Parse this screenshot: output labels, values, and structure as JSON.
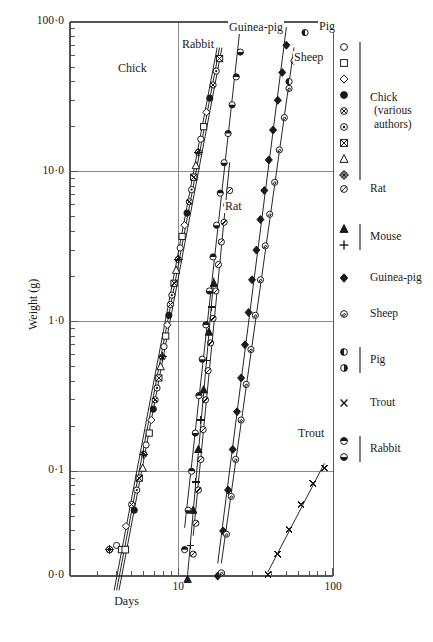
{
  "chart_data": {
    "type": "scatter",
    "title": "",
    "xlabel": "Days",
    "ylabel": "Weight (g)",
    "xscale": "log",
    "yscale": "log",
    "xlim": [
      2,
      100
    ],
    "ylim": [
      0.02,
      100
    ],
    "xticklabels": [
      "10",
      "100"
    ],
    "xtickvalues": [
      10,
      100
    ],
    "yticklabels": [
      "100·0",
      "10·0",
      "1·0",
      "0·1",
      "0·0"
    ],
    "ytickvalues": [
      100,
      10,
      1,
      0.1,
      0.02
    ],
    "grid": "major-horizontal-and-vertical",
    "legend_position": "right",
    "annotations": [
      {
        "text": "Chick",
        "x": 9.0,
        "y": 11.0
      },
      {
        "text": "Rabbit",
        "x": 15.5,
        "y": 45.0
      },
      {
        "text": "Guinea-pig",
        "x": 28.0,
        "y": 80.0
      },
      {
        "text": "Sheep",
        "x": 40.0,
        "y": 47.0
      },
      {
        "text": "Pig",
        "x": 62.0,
        "y": 82.0
      },
      {
        "text": "Rat",
        "x": 17.0,
        "y": 4.2
      },
      {
        "text": "Trout",
        "x": 62.0,
        "y": 0.14
      }
    ],
    "series": [
      {
        "name": "Chick (various authors)",
        "marker": "mixed-open-and-filled",
        "color": "#000000",
        "fit_lines": 3,
        "points": [
          [
            4.0,
            0.032
          ],
          [
            4.3,
            0.03
          ],
          [
            4.6,
            0.043
          ],
          [
            5.2,
            0.055
          ],
          [
            5.0,
            0.06
          ],
          [
            5.4,
            0.075
          ],
          [
            5.6,
            0.09
          ],
          [
            5.9,
            0.105
          ],
          [
            6.0,
            0.13
          ],
          [
            6.2,
            0.15
          ],
          [
            6.5,
            0.18
          ],
          [
            6.7,
            0.22
          ],
          [
            6.9,
            0.26
          ],
          [
            7.1,
            0.3
          ],
          [
            7.3,
            0.36
          ],
          [
            7.5,
            0.42
          ],
          [
            7.7,
            0.5
          ],
          [
            7.9,
            0.58
          ],
          [
            8.1,
            0.68
          ],
          [
            8.3,
            0.8
          ],
          [
            8.5,
            0.95
          ],
          [
            8.7,
            1.1
          ],
          [
            8.9,
            1.3
          ],
          [
            9.1,
            1.5
          ],
          [
            9.4,
            1.8
          ],
          [
            9.7,
            2.2
          ],
          [
            10.0,
            2.6
          ],
          [
            10.3,
            3.1
          ],
          [
            10.6,
            3.7
          ],
          [
            11.0,
            4.4
          ],
          [
            11.4,
            5.3
          ],
          [
            11.8,
            6.3
          ],
          [
            12.2,
            7.6
          ],
          [
            12.6,
            9.2
          ],
          [
            13.0,
            11.0
          ],
          [
            13.5,
            13.5
          ],
          [
            14.0,
            16.5
          ],
          [
            14.6,
            20.0
          ],
          [
            15.2,
            25.0
          ],
          [
            16.0,
            31.0
          ],
          [
            16.8,
            38.0
          ],
          [
            17.6,
            47.0
          ],
          [
            18.5,
            57.0
          ]
        ]
      },
      {
        "name": "Rat",
        "marker": "circle-slash",
        "color": "#000000",
        "fit_lines": 1,
        "points": [
          [
            12.5,
            0.028
          ],
          [
            13.0,
            0.045
          ],
          [
            13.5,
            0.075
          ],
          [
            14.0,
            0.12
          ],
          [
            14.5,
            0.19
          ],
          [
            15.0,
            0.3
          ],
          [
            15.6,
            0.47
          ],
          [
            16.2,
            0.72
          ],
          [
            16.8,
            1.05
          ],
          [
            17.5,
            1.6
          ],
          [
            18.2,
            2.4
          ],
          [
            19.0,
            3.4
          ],
          [
            19.8,
            4.6
          ],
          [
            20.6,
            6.0
          ],
          [
            21.5,
            7.5
          ]
        ]
      },
      {
        "name": "Mouse",
        "marker": "filled-triangle-and-plus",
        "color": "#000000",
        "fit_lines": 1,
        "points": [
          [
            11.5,
            0.019
          ],
          [
            12.0,
            0.032
          ],
          [
            12.5,
            0.055
          ],
          [
            13.0,
            0.085
          ],
          [
            13.5,
            0.14
          ],
          [
            14.0,
            0.22
          ],
          [
            14.6,
            0.35
          ],
          [
            15.2,
            0.55
          ],
          [
            15.8,
            0.85
          ],
          [
            16.4,
            1.25
          ],
          [
            17.0,
            1.8
          ]
        ]
      },
      {
        "name": "Guinea-pig",
        "marker": "filled-diamond",
        "color": "#000000",
        "fit_lines": 1,
        "points": [
          [
            18.0,
            0.02
          ],
          [
            19.5,
            0.04
          ],
          [
            21.0,
            0.075
          ],
          [
            22.5,
            0.14
          ],
          [
            24.0,
            0.25
          ],
          [
            25.5,
            0.42
          ],
          [
            27.0,
            0.7
          ],
          [
            28.5,
            1.15
          ],
          [
            30.0,
            1.9
          ],
          [
            32.0,
            3.0
          ],
          [
            34.0,
            4.8
          ],
          [
            36.0,
            7.5
          ],
          [
            38.5,
            12.0
          ],
          [
            41.0,
            19.0
          ],
          [
            44.0,
            30.0
          ],
          [
            47.0,
            46.0
          ],
          [
            50.0,
            70.0
          ]
        ]
      },
      {
        "name": "Sheep",
        "marker": "circle-dot",
        "color": "#000000",
        "fit_lines": 1,
        "points": [
          [
            19.0,
            0.021
          ],
          [
            20.5,
            0.038
          ],
          [
            22.0,
            0.068
          ],
          [
            23.5,
            0.12
          ],
          [
            25.5,
            0.22
          ],
          [
            27.5,
            0.38
          ],
          [
            29.5,
            0.65
          ],
          [
            31.5,
            1.1
          ],
          [
            34.0,
            1.9
          ],
          [
            36.5,
            3.2
          ],
          [
            39.0,
            5.2
          ],
          [
            42.0,
            8.5
          ],
          [
            45.0,
            14.0
          ],
          [
            48.5,
            23.0
          ],
          [
            52.0,
            36.0
          ],
          [
            56.0,
            55.0
          ]
        ]
      },
      {
        "name": "Pig",
        "marker": "half-filled-circle",
        "color": "#000000",
        "fit_lines": 0,
        "points": [
          [
            52.0,
            40.0
          ],
          [
            58.0,
            60.0
          ],
          [
            66.0,
            85.0
          ]
        ]
      },
      {
        "name": "Trout",
        "marker": "cross-x",
        "color": "#000000",
        "fit_lines": 1,
        "points": [
          [
            38.0,
            0.0205
          ],
          [
            44.0,
            0.028
          ],
          [
            52.0,
            0.041
          ],
          [
            62.0,
            0.06
          ],
          [
            74.0,
            0.083
          ],
          [
            88.0,
            0.105
          ]
        ]
      },
      {
        "name": "Rabbit",
        "marker": "half-filled-circle-horizontal",
        "color": "#000000",
        "fit_lines": 1,
        "points": [
          [
            11.0,
            0.03
          ],
          [
            11.6,
            0.055
          ],
          [
            12.2,
            0.1
          ],
          [
            12.9,
            0.18
          ],
          [
            13.6,
            0.32
          ],
          [
            14.3,
            0.56
          ],
          [
            15.1,
            0.95
          ],
          [
            15.9,
            1.6
          ],
          [
            16.8,
            2.7
          ],
          [
            17.7,
            4.4
          ],
          [
            18.7,
            7.2
          ],
          [
            19.8,
            11.5
          ],
          [
            21.0,
            18.0
          ],
          [
            22.3,
            28.0
          ],
          [
            23.7,
            43.0
          ],
          [
            25.2,
            63.0
          ]
        ]
      }
    ]
  },
  "axes": {
    "y_title": "Weight (g)",
    "x_title": "Days",
    "y_ticks": [
      {
        "label": "100·0",
        "value": 100
      },
      {
        "label": "10·0",
        "value": 10
      },
      {
        "label": "1·0",
        "value": 1
      },
      {
        "label": "0·1",
        "value": 0.1
      },
      {
        "label": "0·0",
        "value": 0.02
      }
    ],
    "x_ticks": [
      {
        "label": "10",
        "value": 10
      },
      {
        "label": "100",
        "value": 100
      }
    ]
  },
  "curve_labels": {
    "chick": "Chick",
    "rabbit": "Rabbit",
    "guinea_pig": "Guinea-pig",
    "sheep": "Sheep",
    "pig": "Pig",
    "rat": "Rat",
    "trout": "Trout"
  },
  "legend": {
    "groups": [
      {
        "id": "chick",
        "label": "Chick\n(various\nauthors)",
        "label_lines": [
          "Chick",
          "(various",
          "authors)"
        ],
        "symbols": [
          "open-circle",
          "open-square",
          "open-diamond",
          "filled-circle",
          "circle-cross-fill",
          "circle-dot",
          "square-cross",
          "open-triangle",
          "circle-plus-cross"
        ],
        "brace": true
      },
      {
        "id": "rat",
        "label": "Rat",
        "label_lines": [
          "Rat"
        ],
        "symbols": [
          "circle-slash"
        ],
        "brace": false
      },
      {
        "id": "mouse",
        "label": "Mouse",
        "label_lines": [
          "Mouse"
        ],
        "symbols": [
          "filled-triangle",
          "plus"
        ],
        "brace": true
      },
      {
        "id": "guinea-pig",
        "label": "Guinea-pig",
        "label_lines": [
          "Guinea-pig"
        ],
        "symbols": [
          "filled-diamond"
        ],
        "brace": false
      },
      {
        "id": "sheep",
        "label": "Sheep",
        "label_lines": [
          "Sheep"
        ],
        "symbols": [
          "circle-swirl"
        ],
        "brace": false
      },
      {
        "id": "pig",
        "label": "Pig",
        "label_lines": [
          "Pig"
        ],
        "symbols": [
          "half-circle-left",
          "half-circle-right"
        ],
        "brace": true
      },
      {
        "id": "trout",
        "label": "Trout",
        "label_lines": [
          "Trout"
        ],
        "symbols": [
          "cross-x"
        ],
        "brace": false
      },
      {
        "id": "rabbit",
        "label": "Rabbit",
        "label_lines": [
          "Rabbit"
        ],
        "symbols": [
          "half-circle-top",
          "half-circle-bottom"
        ],
        "brace": true
      }
    ]
  },
  "colors": {
    "ink": "#1a1a1a",
    "axis": "#555555",
    "grid": "#8a8a8a",
    "background": "#ffffff"
  }
}
